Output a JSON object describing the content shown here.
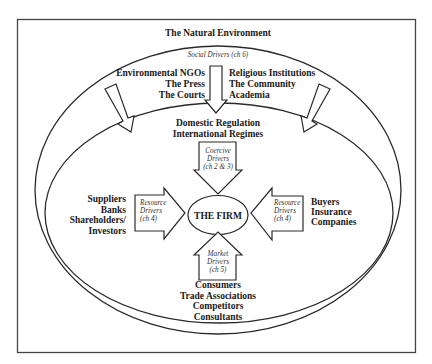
{
  "diagram": {
    "title": "The Natural Environment",
    "social_drivers": {
      "label": "Social Drivers (ch 6)",
      "left_actors": [
        "Environmental NGOs",
        "The Press",
        "The Courts"
      ],
      "right_actors": [
        "Religious Institutions",
        "The Community",
        "Academia"
      ]
    },
    "regulators": [
      "Domestic Regulation",
      "International Regimes"
    ],
    "coercive_drivers": {
      "lines": [
        "Coercive",
        "Drivers",
        "(ch 2 & 3)"
      ]
    },
    "center": "THE FIRM",
    "left_resource_drivers": {
      "lines": [
        "Resource",
        "Drivers",
        "(ch 4)"
      ]
    },
    "right_resource_drivers": {
      "lines": [
        "Resource",
        "Drivers",
        "(ch 4)"
      ]
    },
    "left_actors": [
      "Suppliers",
      "Banks",
      "Shareholders/",
      "Investors"
    ],
    "right_actors": [
      "Buyers",
      "Insurance",
      "Companies"
    ],
    "market_drivers": {
      "lines": [
        "Market",
        "Drivers",
        "(ch 5)"
      ]
    },
    "bottom_actors": [
      "Consumers",
      "Trade Associations",
      "Competitors",
      "Consultants"
    ],
    "colors": {
      "line": "#2a2a2a",
      "background": "#ffffff",
      "text": "#1a1a1a"
    }
  }
}
